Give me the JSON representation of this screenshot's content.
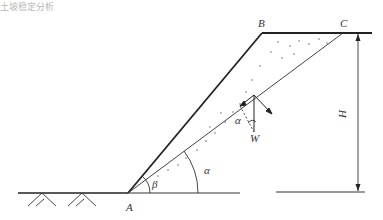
{
  "header_fragment": "土坡稳定分析",
  "diagram": {
    "points": {
      "A": {
        "label": "A"
      },
      "B": {
        "label": "B"
      },
      "C": {
        "label": "C"
      }
    },
    "force_label": "W",
    "angles": {
      "slope_angle": "β",
      "slip_plane_angle": "α",
      "force_angle": "α"
    },
    "height_label": "H",
    "colors": {
      "line": "#222222",
      "thin_line": "#444444",
      "text": "#333333"
    }
  }
}
